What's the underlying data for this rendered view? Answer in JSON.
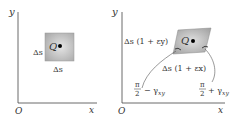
{
  "left_panel": {
    "axis_y_label": "y",
    "axis_x_label": "x",
    "origin_label": "O",
    "point_label": "Q",
    "side_vertical_label": "Δs",
    "side_horizontal_label": "Δs",
    "square_fill": "#b8b8b8"
  },
  "right_panel": {
    "axis_y_label": "y",
    "axis_x_label": "x",
    "origin_label": "O",
    "point_label": "Q",
    "side_vertical_label": "Δs (1 + εy)",
    "side_horizontal_label": "Δs (1 + εx)",
    "angle_left_label": "π/2 − γxy",
    "angle_right_label": "π/2 + γxy",
    "shape_fill": "#b0b0b0"
  },
  "colors": {
    "axis": "#444444",
    "text": "#333333",
    "point": "#000000"
  }
}
